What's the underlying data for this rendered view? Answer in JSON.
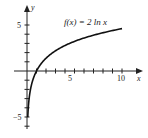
{
  "chart_data": {
    "type": "line",
    "title": "",
    "function_label": "f(x) = 2 ln x",
    "xlabel": "x",
    "ylabel": "y",
    "xlim": [
      0,
      11.5
    ],
    "ylim": [
      -6,
      5.8
    ],
    "x_ticks": [
      1,
      2,
      3,
      4,
      5,
      6,
      7,
      8,
      9,
      10
    ],
    "x_tick_labels": [
      {
        "value": 5,
        "text": "5"
      },
      {
        "value": 10,
        "text": "10"
      }
    ],
    "y_ticks": [
      -6,
      -5,
      -4,
      -3,
      -2,
      -1,
      1,
      2,
      3,
      4,
      5
    ],
    "y_tick_labels": [
      {
        "value": 5,
        "text": "5"
      },
      {
        "value": -5,
        "text": "−5"
      }
    ],
    "grid": false,
    "series": [
      {
        "name": "f(x) = 2 ln x",
        "x": [
          0.082,
          0.1,
          0.15,
          0.2,
          0.3,
          0.5,
          0.75,
          1,
          1.5,
          2,
          3,
          4,
          5,
          6,
          7,
          8,
          9,
          10
        ],
        "y": [
          -5.0,
          -4.61,
          -3.79,
          -3.22,
          -2.41,
          -1.39,
          -0.58,
          0.0,
          0.81,
          1.39,
          2.2,
          2.77,
          3.22,
          3.58,
          3.89,
          4.16,
          4.39,
          4.61
        ]
      }
    ],
    "colors": {
      "curve": "#111111",
      "axis": "#222222"
    }
  },
  "labels": {
    "x_axis": "x",
    "y_axis": "y",
    "function": "f(x) = 2 ln x",
    "tick_x_5": "5",
    "tick_x_10": "10",
    "tick_y_5": "5",
    "tick_y_neg5": "−5"
  }
}
